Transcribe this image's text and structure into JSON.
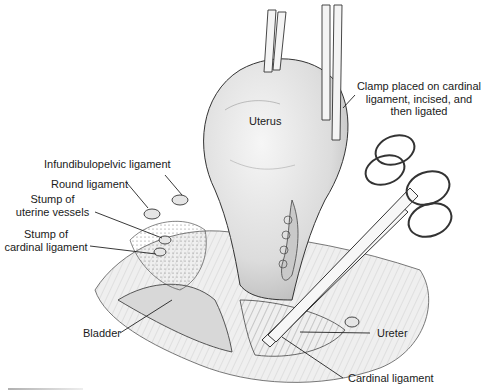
{
  "figure": {
    "labels": {
      "uterus": "Uterus",
      "clamp": "Clamp placed on cardinal\nligament, incised, and\nthen ligated",
      "infundibulopelvic": "Infundibulopelvic ligament",
      "round": "Round ligament",
      "uterine_vessels": "Stump of\nuterine vessels",
      "cardinal_stump": "Stump of\ncardinal ligament",
      "bladder": "Bladder",
      "ureter": "Ureter",
      "cardinal": "Cardinal ligament"
    },
    "colors": {
      "line": "#222222",
      "tissue_fill": "#ececec",
      "uterus_fill": "#e2e2e2",
      "background": "#ffffff"
    }
  }
}
